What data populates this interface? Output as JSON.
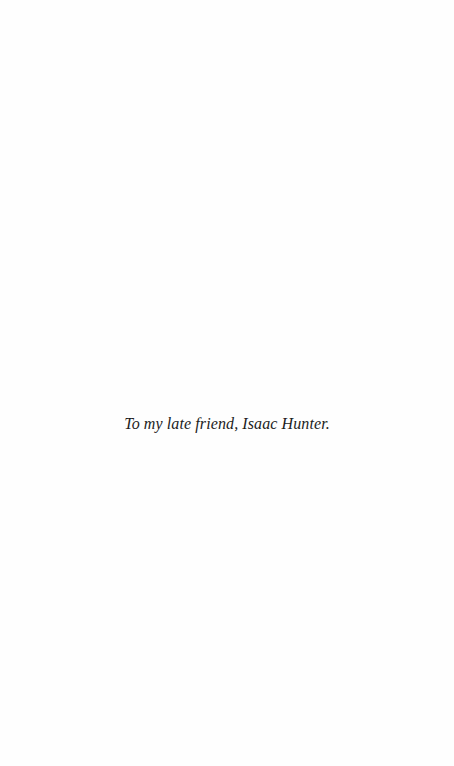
{
  "page": {
    "type": "dedication-page",
    "background_color": "#fefefe",
    "text_color": "#1c1c1c"
  },
  "dedication": {
    "text": "To my late friend, Isaac Hunter."
  }
}
